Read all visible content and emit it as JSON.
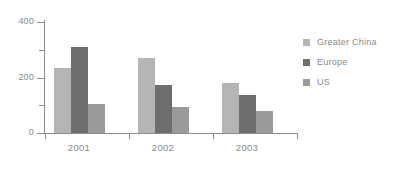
{
  "chart_data": {
    "type": "bar",
    "title": "",
    "subtitle": "",
    "xlabel": "",
    "ylabel": "",
    "categories": [
      "2001",
      "2002",
      "2003"
    ],
    "series": [
      {
        "name": "Greater China",
        "color": "#b5b5b5",
        "values": [
          235,
          270,
          182
        ]
      },
      {
        "name": "Europe",
        "color": "#6e6e6e",
        "values": [
          310,
          172,
          138
        ]
      },
      {
        "name": "US",
        "color": "#9a9a9a",
        "values": [
          103,
          92,
          80
        ]
      }
    ],
    "ylim": [
      0,
      400
    ],
    "ytick_labels": [
      "0",
      "200",
      "400"
    ],
    "ytick_values": [
      0,
      200,
      400
    ],
    "yminor_values": [
      100,
      300
    ],
    "grid": false,
    "legend_position": "right",
    "axis_color": "#8c8c8c",
    "tick_label_color": "#8a8a8a"
  },
  "legend": {
    "entries": [
      {
        "label": "Greater China"
      },
      {
        "label": "Europe"
      },
      {
        "label": "US"
      }
    ]
  }
}
